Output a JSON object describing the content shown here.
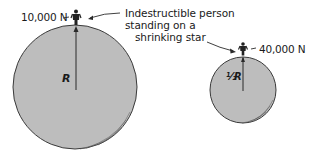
{
  "diagram": {
    "caption_lines": [
      "Indestructible person",
      "standing on a",
      "shrinking star"
    ],
    "large_star": {
      "weight_label": "10,000 N",
      "radius_label": "R"
    },
    "small_star": {
      "weight_label": "40,000 N",
      "radius_label_prefix": "½",
      "radius_label": "R"
    },
    "colors": {
      "star_fill": "#bdbdbd",
      "outline": "#3a3a3a",
      "text": "#1a1a1a"
    }
  }
}
